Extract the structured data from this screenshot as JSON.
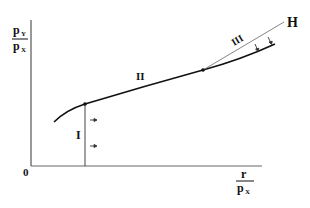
{
  "diagram": {
    "type": "economic-phase-diagram",
    "y_axis_label": {
      "numerator": "p",
      "numerator_sub": "Y",
      "denominator": "p",
      "denominator_sub": "X"
    },
    "x_axis_label": {
      "numerator": "r",
      "denominator": "p",
      "denominator_sub": "X"
    },
    "origin_label": "0",
    "regions": [
      {
        "id": "I",
        "label": "I"
      },
      {
        "id": "II",
        "label": "II"
      },
      {
        "id": "III",
        "label": "III"
      }
    ],
    "line_label": "H",
    "colors": {
      "ink": "#111111",
      "axis": "#555555",
      "thin_line": "#777777"
    }
  }
}
